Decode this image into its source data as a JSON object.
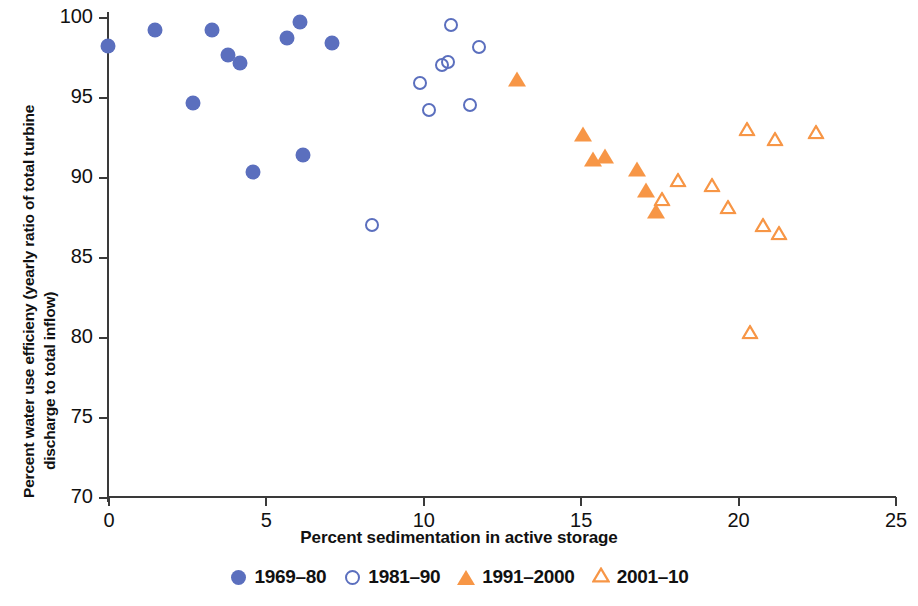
{
  "chart_data": {
    "type": "scatter",
    "title": "",
    "xlabel": "Percent sedimentation in active storage",
    "ylabel_line1": "Percent water use efficieny (yearly ratio of total turbine",
    "ylabel_line2": "discharge to total inflow)",
    "xlim": [
      0,
      25
    ],
    "ylim": [
      70,
      100
    ],
    "xticks": [
      0,
      5,
      10,
      15,
      20,
      25
    ],
    "yticks": [
      70,
      75,
      80,
      85,
      90,
      95,
      100
    ],
    "grid": false,
    "legend_position": "bottom-center",
    "series": [
      {
        "name": "1969-80",
        "marker": "circle-filled",
        "color": "#5B6FBE",
        "points": [
          {
            "x": 0.0,
            "y": 98.2
          },
          {
            "x": 1.5,
            "y": 99.2
          },
          {
            "x": 2.7,
            "y": 94.6
          },
          {
            "x": 3.3,
            "y": 99.2
          },
          {
            "x": 3.8,
            "y": 97.6
          },
          {
            "x": 4.2,
            "y": 97.1
          },
          {
            "x": 4.6,
            "y": 90.3
          },
          {
            "x": 5.7,
            "y": 98.7
          },
          {
            "x": 6.1,
            "y": 99.7
          },
          {
            "x": 6.2,
            "y": 91.4
          },
          {
            "x": 7.1,
            "y": 98.4
          }
        ]
      },
      {
        "name": "1981-90",
        "marker": "circle-open",
        "color": "#5B6FBE",
        "points": [
          {
            "x": 8.4,
            "y": 87.0
          },
          {
            "x": 9.9,
            "y": 95.9
          },
          {
            "x": 10.2,
            "y": 94.2
          },
          {
            "x": 10.6,
            "y": 97.0
          },
          {
            "x": 10.8,
            "y": 97.2
          },
          {
            "x": 10.9,
            "y": 99.5
          },
          {
            "x": 11.5,
            "y": 94.5
          },
          {
            "x": 11.8,
            "y": 98.1
          }
        ]
      },
      {
        "name": "1991-2000",
        "marker": "triangle-filled",
        "color": "#F79646",
        "points": [
          {
            "x": 13.0,
            "y": 96.1
          },
          {
            "x": 15.1,
            "y": 92.7
          },
          {
            "x": 15.4,
            "y": 91.1
          },
          {
            "x": 15.8,
            "y": 91.3
          },
          {
            "x": 16.8,
            "y": 90.5
          },
          {
            "x": 17.1,
            "y": 89.2
          },
          {
            "x": 17.4,
            "y": 87.9
          }
        ]
      },
      {
        "name": "2001-10",
        "marker": "triangle-open",
        "color": "#F79646",
        "points": [
          {
            "x": 17.6,
            "y": 88.6
          },
          {
            "x": 18.1,
            "y": 89.8
          },
          {
            "x": 19.2,
            "y": 89.5
          },
          {
            "x": 19.7,
            "y": 88.1
          },
          {
            "x": 20.3,
            "y": 93.0
          },
          {
            "x": 20.4,
            "y": 80.3
          },
          {
            "x": 20.8,
            "y": 87.0
          },
          {
            "x": 21.2,
            "y": 92.4
          },
          {
            "x": 21.3,
            "y": 86.5
          },
          {
            "x": 22.5,
            "y": 92.8
          }
        ]
      }
    ]
  },
  "legend": {
    "items": [
      {
        "label": "1969–80",
        "marker": "circle-filled",
        "color": "#5B6FBE"
      },
      {
        "label": "1981–90",
        "marker": "circle-open",
        "color": "#5B6FBE"
      },
      {
        "label": "1991–2000",
        "marker": "triangle-filled",
        "color": "#F79646"
      },
      {
        "label": "2001–10",
        "marker": "triangle-open",
        "color": "#F79646"
      }
    ]
  }
}
